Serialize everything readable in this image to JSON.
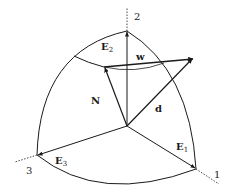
{
  "diagram": {
    "axes": [
      {
        "id": "axis-1",
        "label": "1",
        "vector_label": "E",
        "vector_sub": "1"
      },
      {
        "id": "axis-2",
        "label": "2",
        "vector_label": "E",
        "vector_sub": "2"
      },
      {
        "id": "axis-3",
        "label": "3",
        "vector_label": "E",
        "vector_sub": "3"
      }
    ],
    "vectors": [
      {
        "id": "N",
        "label": "N"
      },
      {
        "id": "d",
        "label": "d"
      },
      {
        "id": "w",
        "label": "w"
      }
    ],
    "colors": {
      "stroke": "#1a1a1a",
      "background": "#ffffff"
    }
  }
}
